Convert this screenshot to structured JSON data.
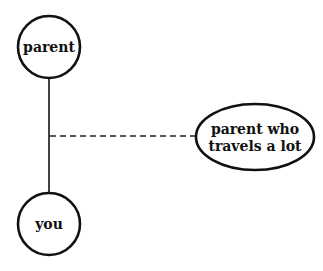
{
  "diagram": {
    "nodes": [
      {
        "id": "parent",
        "label_lines": [
          "parent"
        ],
        "shape": "circle",
        "cx": 49,
        "cy": 47,
        "r": 31
      },
      {
        "id": "you",
        "label_lines": [
          "you"
        ],
        "shape": "circle",
        "cx": 49,
        "cy": 224,
        "r": 31
      },
      {
        "id": "parent-travels",
        "label_lines": [
          "parent who",
          "travels a lot"
        ],
        "shape": "ellipse",
        "cx": 255,
        "cy": 137,
        "rx": 59,
        "ry": 33
      }
    ],
    "edges": [
      {
        "from": "parent",
        "to": "you",
        "style": "solid"
      },
      {
        "from": "parent-you-line",
        "to": "parent-travels",
        "style": "dashed"
      }
    ],
    "colors": {
      "stroke": "#111111",
      "background": "#ffffff"
    }
  }
}
